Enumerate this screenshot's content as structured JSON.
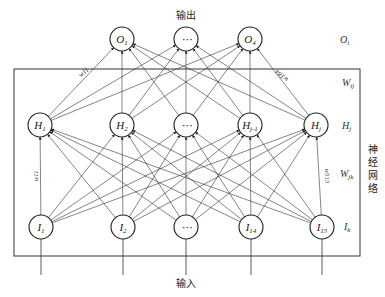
{
  "diagram": {
    "type": "neural-network",
    "title_top": "输出",
    "title_bottom": "输入",
    "box_label": "神经网络",
    "box_label_chars": [
      "神",
      "经",
      "网",
      "络"
    ],
    "layers": {
      "output": {
        "side_label": "O_i",
        "nodes": [
          {
            "label": "O",
            "sub": "1",
            "x": 122
          },
          {
            "label": "⋯",
            "sub": "",
            "x": 186
          },
          {
            "label": "O",
            "sub": "4",
            "x": 250
          }
        ]
      },
      "hidden": {
        "side_label": "H_j",
        "nodes": [
          {
            "label": "H",
            "sub": "1",
            "x": 40
          },
          {
            "label": "H",
            "sub": "2",
            "x": 122
          },
          {
            "label": "⋯",
            "sub": "",
            "x": 186
          },
          {
            "label": "H",
            "sub": "j-1",
            "x": 250
          },
          {
            "label": "H",
            "sub": "j",
            "x": 316
          }
        ]
      },
      "input": {
        "side_label": "I_k",
        "nodes": [
          {
            "label": "I",
            "sub": "1",
            "x": 41
          },
          {
            "label": "I",
            "sub": "2",
            "x": 123
          },
          {
            "label": "⋯",
            "sub": "",
            "x": 186
          },
          {
            "label": "I",
            "sub": "14",
            "x": 251
          },
          {
            "label": "I",
            "sub": "15",
            "x": 322
          }
        ]
      }
    },
    "weights": {
      "hidden_output_label": "W_ij",
      "input_hidden_label": "W_jk",
      "annotations": [
        "w11",
        "w184",
        "w11",
        "w515"
      ]
    },
    "side_labels": {
      "O": {
        "main": "O",
        "sub": "i"
      },
      "Wij": {
        "main": "W",
        "sub": "ij"
      },
      "H": {
        "main": "H",
        "sub": "j"
      },
      "Wjk": {
        "main": "W",
        "sub": "jk"
      },
      "I": {
        "main": "I",
        "sub": "k"
      }
    },
    "colors": {
      "line": "#333333",
      "background": "#ffffff"
    }
  }
}
